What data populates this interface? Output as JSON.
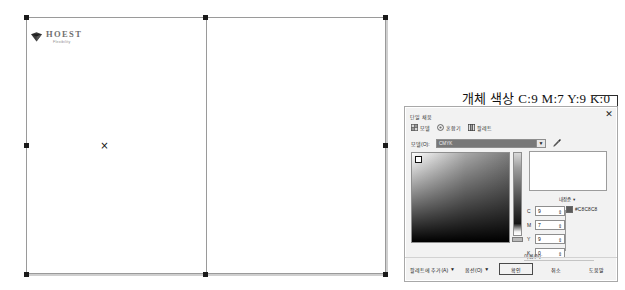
{
  "document": {
    "logo": {
      "name": "HOEST",
      "tagline": "Flexibility",
      "icon": "gem-icon"
    },
    "selection": {
      "handle_count": 8,
      "center_marker": "×"
    }
  },
  "annotation": {
    "title": "개체 색상  C:9 M:7 Y:9 K:0",
    "leader_line": true
  },
  "dialog": {
    "section_title": "단일 채움",
    "close_label": "✕",
    "modes": [
      {
        "label": "모델",
        "icon": "model-grid-icon"
      },
      {
        "label": "혼합기",
        "icon": "mixer-circle-icon"
      },
      {
        "label": "팔레트",
        "icon": "palette-icon"
      }
    ],
    "model_dropdown": {
      "label": "모델(O):",
      "value": "CMYK",
      "arrow": "▼"
    },
    "eyedropper": "eyedropper-icon",
    "gradient_picker": {
      "cursor_position": "top-left"
    },
    "reference_dropdown": {
      "label": "내장준",
      "arrow": "▾"
    },
    "components": [
      {
        "label": "C",
        "value": "9"
      },
      {
        "label": "M",
        "value": "7"
      },
      {
        "label": "Y",
        "value": "9"
      },
      {
        "label": "K",
        "value": "0"
      }
    ],
    "spinner_glyph": "⇕",
    "hex": {
      "swatch": "#5B5B5B",
      "value": "#C8C8C8"
    },
    "name_field": {
      "label": "이름(N):",
      "value": ""
    },
    "footer": {
      "add_to_palette": "팔레트에 추가(A)",
      "add_arrow": "▼",
      "options": "옵션(O)",
      "options_arrow": "▼",
      "ok": "확인",
      "cancel": "취소",
      "help": "도움말"
    }
  },
  "colors": {
    "dialog_bg": "#F2F2F2",
    "dialog_border": "#A8A8A8",
    "page_border": "#9A9A9A",
    "handle": "#1A1A1A",
    "logo_text": "#6F6F6F"
  }
}
